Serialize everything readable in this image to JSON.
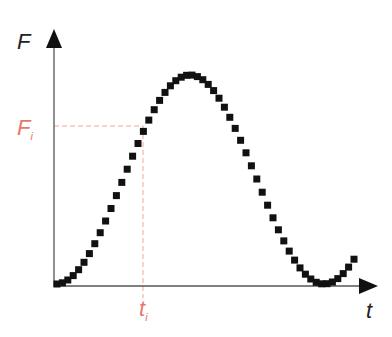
{
  "chart_data": {
    "type": "scatter",
    "title": "",
    "xlabel": "t",
    "ylabel": "F",
    "annotations": [
      {
        "label": "F",
        "sub": "i",
        "axis": "y",
        "color": "#e8776b"
      },
      {
        "label": "t",
        "sub": "i",
        "axis": "x",
        "color": "#e8776b"
      }
    ],
    "grid": false,
    "legend": null,
    "marker": "square",
    "marker_color": "#111111",
    "axis_color": "#333333",
    "highlight_color": "#f0a49a",
    "points_px": {
      "origin": [
        54,
        286
      ],
      "x_axis_end": 377,
      "y_axis_top": 30,
      "Fi_y": 126,
      "ti_x": 143,
      "curve": {
        "x_start": 57,
        "x_end": 358,
        "step": 5.4,
        "center_y": 179.5,
        "amplitude": 104.5,
        "peak_x": 190,
        "period": 268
      }
    }
  },
  "labels": {
    "y_axis": "F",
    "x_axis": "t",
    "Fi_main": "F",
    "Fi_sub": "i",
    "ti_main": "t",
    "ti_sub": "i"
  }
}
